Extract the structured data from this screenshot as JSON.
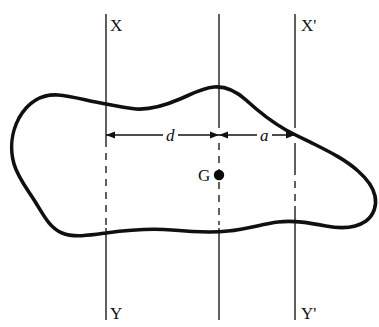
{
  "figure": {
    "type": "engineering-diagram",
    "background_color": "#ffffff",
    "outline_color": "#101010",
    "axis_color": "#2b2b2b",
    "width": 379,
    "height": 327
  },
  "axes": [
    {
      "id": "axis-xy",
      "top_label": "X",
      "bottom_label": "Y",
      "x": 106,
      "top_label_x": 110,
      "top_label_y": 17,
      "bottom_label_x": 110,
      "bottom_label_y": 305,
      "y_start": 14,
      "y_end": 320,
      "solid_segments": [
        [
          14,
          104
        ],
        [
          104,
          140
        ],
        [
          228,
          320
        ]
      ],
      "dashed_segments": [
        [
          140,
          228
        ]
      ]
    },
    {
      "id": "axis-centroidal",
      "top_label": "",
      "bottom_label": "",
      "x": 219,
      "y_start": 14,
      "y_end": 320,
      "solid_segments": [
        [
          14,
          128
        ],
        [
          228,
          320
        ]
      ],
      "dashed_segments": [
        [
          143,
          225
        ]
      ]
    },
    {
      "id": "axis-xy-prime",
      "top_label": "X'",
      "bottom_label": "Y'",
      "x": 295,
      "top_label_x": 301,
      "top_label_y": 17,
      "bottom_label_x": 301,
      "bottom_label_y": 305,
      "y_start": 14,
      "y_end": 320,
      "solid_segments": [
        [
          14,
          128
        ],
        [
          143,
          168
        ],
        [
          206,
          320
        ]
      ],
      "dashed_segments": [
        [
          168,
          206
        ]
      ]
    }
  ],
  "dimensions": [
    {
      "id": "dimension-d",
      "label": "d",
      "label_x": 163,
      "label_y": 127,
      "y": 135,
      "x_from": 106,
      "x_to": 219,
      "arrow_left": true,
      "arrow_right": true
    },
    {
      "id": "dimension-a",
      "label": "a",
      "label_x": 257,
      "label_y": 127,
      "y": 135,
      "x_from": 219,
      "x_to": 295,
      "arrow_left": true,
      "arrow_right": true
    }
  ],
  "centroid": {
    "id": "centroid-G",
    "label": "G",
    "label_x": 198,
    "label_y": 167,
    "dot_x": 219,
    "dot_y": 175,
    "dot_radius": 5.2
  },
  "shape": {
    "id": "area-outline",
    "stroke_width": 3.6,
    "path": "M 106 104 C 88 101, 72 96, 58 95 C 42 94, 28 102, 19 118 C 11 133, 10 150, 14 164 C 18 178, 28 190, 36 203 C 44 216, 50 228, 62 233 C 74 238, 92 235, 106 233 C 128 230, 150 228, 172 230 C 194 232, 212 233, 228 231 C 248 229, 262 224, 278 222 C 294 220, 310 223, 326 226 C 342 229, 356 228, 366 221 C 374 215, 377 205, 375 196 C 373 186, 366 178, 358 171 C 346 160, 330 152, 314 144 C 304 139, 295 135, 286 130 C 272 122, 258 111, 246 100 C 236 91, 226 86, 214 87 C 202 88, 192 94, 180 99 C 166 105, 150 110, 136 109 C 126 108, 116 106, 106 104 Z"
  }
}
